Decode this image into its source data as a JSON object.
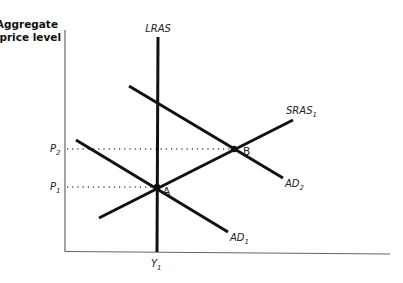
{
  "diagram": {
    "y_axis_title_line1": "Aggregate",
    "y_axis_title_line2": "price level",
    "curves": {
      "lras": {
        "label": "LRAS"
      },
      "sras": {
        "label": "SRAS",
        "subscript": "1"
      },
      "ad1": {
        "label": "AD",
        "subscript": "1"
      },
      "ad2": {
        "label": "AD",
        "subscript": "2"
      }
    },
    "points": {
      "a": {
        "label": "A"
      },
      "b": {
        "label": "B"
      }
    },
    "y_ticks": {
      "p1": {
        "label": "P",
        "subscript": "1"
      },
      "p2": {
        "label": "P",
        "subscript": "2"
      }
    },
    "x_ticks": {
      "y1": {
        "label": "Y",
        "subscript": "1"
      }
    }
  },
  "colors": {
    "curve": "#111111",
    "axis": "#555555",
    "dotted": "#444444"
  }
}
